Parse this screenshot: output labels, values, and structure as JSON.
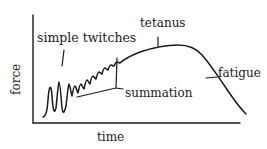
{
  "diagram": {
    "type": "muscle-force-time-curve",
    "colors": {
      "ink": "#1a1a1a",
      "background": "#ffffff"
    },
    "axes": {
      "x_label": "time",
      "y_label": "force"
    },
    "annotations": {
      "simple_twitches": "simple twitches",
      "tetanus": "tetanus",
      "summation": "summation",
      "fatigue": "fatigue"
    }
  }
}
